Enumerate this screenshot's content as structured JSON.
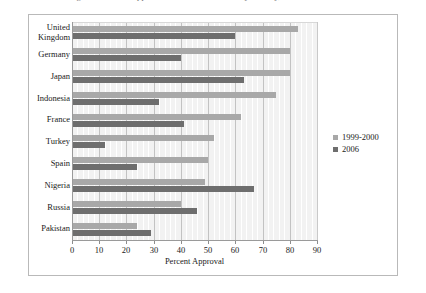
{
  "caption": "Figure 1. Percent approval of the United States by country, 1999-2000 and 2006",
  "chart_data": {
    "type": "bar",
    "orientation": "horizontal",
    "title": "",
    "xlabel": "Percent Approval",
    "ylabel": "",
    "xlim": [
      0,
      90
    ],
    "xticks": [
      0,
      10,
      20,
      30,
      40,
      50,
      60,
      70,
      80,
      90
    ],
    "grid": true,
    "grid_minor_step": 2,
    "legend_position": "right",
    "categories": [
      "United Kingdom",
      "Germany",
      "Japan",
      "Indonesia",
      "France",
      "Turkey",
      "Spain",
      "Nigeria",
      "Russia",
      "Pakistan"
    ],
    "series": [
      {
        "name": "1999-2000",
        "color": "#a8a8a8",
        "values": [
          83,
          80,
          80,
          75,
          62,
          52,
          50,
          49,
          40,
          24
        ]
      },
      {
        "name": "2006",
        "color": "#6e6e6e",
        "values": [
          60,
          40,
          63,
          32,
          41,
          12,
          24,
          67,
          46,
          29
        ]
      }
    ]
  },
  "legend": {
    "items": [
      {
        "label": "1999-2000",
        "color": "#a8a8a8"
      },
      {
        "label": "2006",
        "color": "#6e6e6e"
      }
    ]
  }
}
